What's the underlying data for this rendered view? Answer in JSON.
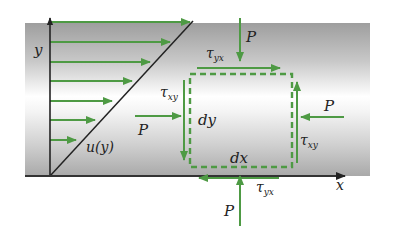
{
  "figure": {
    "colors": {
      "arrow_green": "#4e9a44",
      "axis_dark": "#222222",
      "band_gray": "#a8a8a8",
      "band_light": "#ffffff"
    }
  },
  "axes": {
    "x_label": "x",
    "y_label": "y"
  },
  "profile": {
    "label": "u(y)"
  },
  "element": {
    "dx_label": "dx",
    "dy_label": "dy"
  },
  "forces": {
    "top_pressure": {
      "symbol": "P"
    },
    "bottom_pressure": {
      "symbol": "P"
    },
    "left_pressure": {
      "symbol": "P"
    },
    "right_pressure": {
      "symbol": "P"
    },
    "top_shear": {
      "symbol": "τ",
      "subscript": "yx"
    },
    "bottom_shear": {
      "symbol": "τ",
      "subscript": "yx"
    },
    "left_shear": {
      "symbol": "τ",
      "subscript": "xy"
    },
    "right_shear": {
      "symbol": "τ",
      "subscript": "xy"
    }
  }
}
